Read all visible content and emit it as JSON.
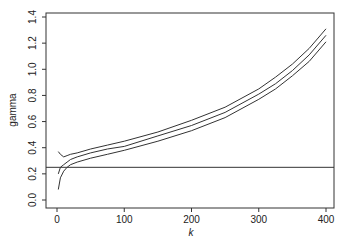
{
  "chart_data": {
    "type": "line",
    "title": "",
    "xlabel": "k",
    "ylabel": "gamma",
    "xlim": [
      0,
      400
    ],
    "ylim": [
      0.0,
      1.4
    ],
    "xticks": [
      0,
      100,
      200,
      300,
      400
    ],
    "yticks": [
      0.0,
      0.2,
      0.4,
      0.6,
      0.8,
      1.0,
      1.2,
      1.4
    ],
    "xtick_labels": [
      "0",
      "100",
      "200",
      "300",
      "400"
    ],
    "ytick_labels": [
      "0.0",
      "0.2",
      "0.4",
      "0.6",
      "0.8",
      "1.0",
      "1.2",
      "1.4"
    ],
    "grid": false,
    "legend": null,
    "reference_line": {
      "orientation": "horizontal",
      "y": 0.25
    },
    "x": [
      2,
      5,
      10,
      15,
      20,
      30,
      50,
      75,
      100,
      150,
      200,
      250,
      300,
      325,
      350,
      375,
      400
    ],
    "series": [
      {
        "name": "upper",
        "values": [
          0.37,
          0.35,
          0.33,
          0.34,
          0.35,
          0.36,
          0.39,
          0.42,
          0.45,
          0.52,
          0.61,
          0.71,
          0.85,
          0.94,
          1.04,
          1.16,
          1.31
        ]
      },
      {
        "name": "estimate",
        "values": [
          0.2,
          0.25,
          0.27,
          0.29,
          0.31,
          0.33,
          0.36,
          0.39,
          0.41,
          0.49,
          0.57,
          0.67,
          0.81,
          0.89,
          0.99,
          1.11,
          1.26
        ]
      },
      {
        "name": "lower",
        "values": [
          0.08,
          0.17,
          0.22,
          0.25,
          0.27,
          0.29,
          0.32,
          0.35,
          0.38,
          0.45,
          0.53,
          0.63,
          0.77,
          0.85,
          0.95,
          1.06,
          1.21
        ]
      }
    ]
  },
  "labels": {
    "xlabel": "k",
    "ylabel": "gamma"
  }
}
